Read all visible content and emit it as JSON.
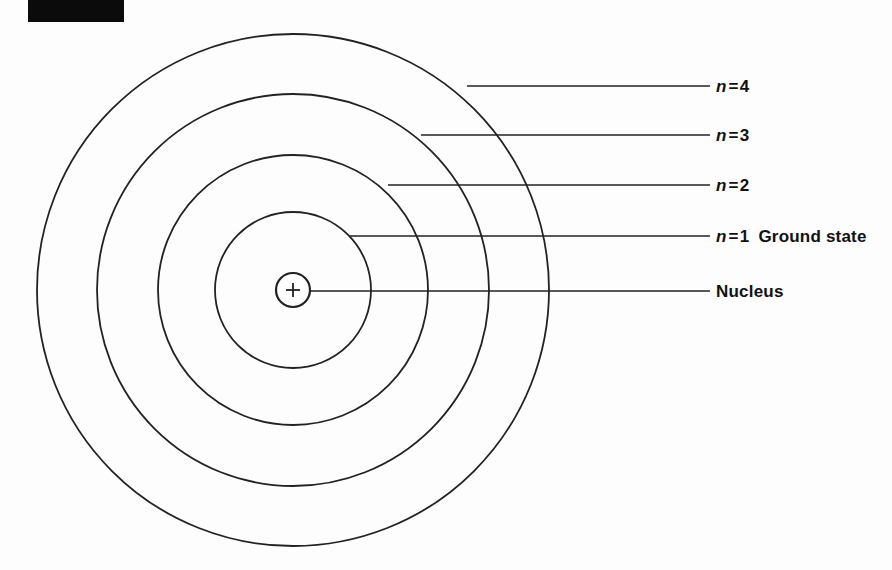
{
  "figure": {
    "title_block": {
      "name": "redacted-caption-block",
      "visible_text": "",
      "color": "#0b0b0b",
      "x": 28,
      "y": 0,
      "width": 96,
      "height": 22
    },
    "background_color": "#fdfdfd",
    "stroke_color": "#222222",
    "center": {
      "x": 293,
      "y": 290
    },
    "shells": [
      {
        "id": "shell-n4",
        "n": 4,
        "radius": 256,
        "label": "n = 4"
      },
      {
        "id": "shell-n3",
        "n": 3,
        "radius": 196,
        "label": "n = 3"
      },
      {
        "id": "shell-n2",
        "n": 2,
        "radius": 135,
        "label": "n = 2"
      },
      {
        "id": "shell-n1",
        "n": 1,
        "radius": 78,
        "label": "n = 1"
      }
    ],
    "nucleus": {
      "id": "nucleus",
      "radius": 17,
      "charge_symbol": "+",
      "label": "Nucleus"
    },
    "leader_lines": [
      {
        "id": "leader-n4",
        "x1": 467,
        "y1": 86,
        "x2": 710,
        "y2": 86
      },
      {
        "id": "leader-n3",
        "x1": 421,
        "y1": 135,
        "x2": 710,
        "y2": 135
      },
      {
        "id": "leader-n2",
        "x1": 388,
        "y1": 185,
        "x2": 710,
        "y2": 185
      },
      {
        "id": "leader-n1",
        "x1": 350,
        "y1": 236,
        "x2": 710,
        "y2": 236
      },
      {
        "id": "leader-nucleus",
        "x1": 310,
        "y1": 291,
        "x2": 710,
        "y2": 291
      }
    ],
    "labels": [
      {
        "id": "label-n4",
        "name": "shell-label-n4",
        "symbol": "n",
        "equals": "=",
        "value": "4",
        "suffix": "",
        "x": 716,
        "y": 78
      },
      {
        "id": "label-n3",
        "name": "shell-label-n3",
        "symbol": "n",
        "equals": "=",
        "value": "3",
        "suffix": "",
        "x": 716,
        "y": 127
      },
      {
        "id": "label-n2",
        "name": "shell-label-n2",
        "symbol": "n",
        "equals": "=",
        "value": "2",
        "suffix": "",
        "x": 716,
        "y": 177
      },
      {
        "id": "label-n1",
        "name": "shell-label-n1",
        "symbol": "n",
        "equals": "=",
        "value": "1",
        "suffix": "Ground state",
        "x": 716,
        "y": 228
      }
    ],
    "nucleus_label": {
      "id": "label-nucleus",
      "name": "nucleus-label",
      "text": "Nucleus",
      "x": 716,
      "y": 283
    }
  }
}
